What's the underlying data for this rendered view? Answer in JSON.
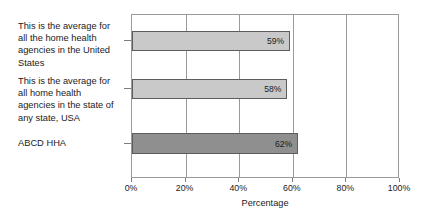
{
  "chart_data": {
    "type": "bar",
    "orientation": "horizontal",
    "title": "",
    "xlabel": "Percentage",
    "ylabel": "",
    "xlim": [
      0,
      100
    ],
    "xtick_labels": [
      "0%",
      "20%",
      "40%",
      "60%",
      "80%",
      "100%"
    ],
    "xtick_values": [
      0,
      20,
      40,
      60,
      80,
      100
    ],
    "grid": true,
    "legend": "none",
    "categories": [
      "This is the average for all the home health agencies in the United States",
      "This is the average for all home health agencies in the state of any state, USA",
      "ABCD HHA"
    ],
    "values": [
      59,
      58,
      62
    ],
    "data_labels": [
      "59%",
      "58%",
      "62%"
    ],
    "bar_colors": [
      "#c9c9c9",
      "#c9c9c9",
      "#8f8f8f"
    ],
    "bar_border_color": "#5c5c5c",
    "axis_color": "#9a9a9a",
    "background_color": "#ffffff",
    "text_color": "#1b1b1b"
  }
}
